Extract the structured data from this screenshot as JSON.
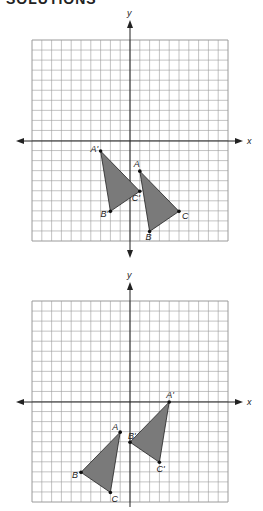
{
  "header": {
    "text": "SOLUTIONS"
  },
  "colors": {
    "grid": "#9a9a9a",
    "axis": "#222222",
    "fill": "#7a7a7a",
    "stroke": "#222222"
  },
  "chart_data": [
    {
      "type": "diagram",
      "title": "Translation of triangle ABC",
      "xlabel": "x",
      "ylabel": "y",
      "xlim": [
        -10,
        10
      ],
      "ylim": [
        -10,
        10
      ],
      "grid": true,
      "original": {
        "A": [
          1,
          -3
        ],
        "B": [
          2,
          -9
        ],
        "C": [
          5,
          -7
        ]
      },
      "image": {
        "A'": [
          -3,
          -1
        ],
        "B'": [
          -2,
          -7
        ],
        "C'": [
          1,
          -5
        ]
      },
      "translation": [
        -4,
        2
      ]
    },
    {
      "type": "diagram",
      "title": "Translation of triangle ABC",
      "xlabel": "x",
      "ylabel": "y",
      "xlim": [
        -10,
        10
      ],
      "ylim": [
        -10,
        10
      ],
      "grid": true,
      "original": {
        "A": [
          -1,
          -3
        ],
        "B": [
          -5,
          -7
        ],
        "C": [
          -2,
          -9
        ]
      },
      "image": {
        "A'": [
          4,
          0
        ],
        "B'": [
          0,
          -4
        ],
        "C'": [
          3,
          -6
        ]
      },
      "translation": [
        5,
        3
      ]
    }
  ],
  "graphs": [
    {
      "axis_x_label": "x",
      "axis_y_label": "y",
      "labels": {
        "A": "A",
        "B": "B",
        "C": "C",
        "Ap": "A'",
        "Bp": "B'",
        "Cp": "C'"
      }
    },
    {
      "axis_x_label": "x",
      "axis_y_label": "y",
      "labels": {
        "A": "A",
        "B": "B",
        "C": "C",
        "Ap": "A'",
        "Bp": "B'",
        "Cp": "C'"
      }
    }
  ]
}
